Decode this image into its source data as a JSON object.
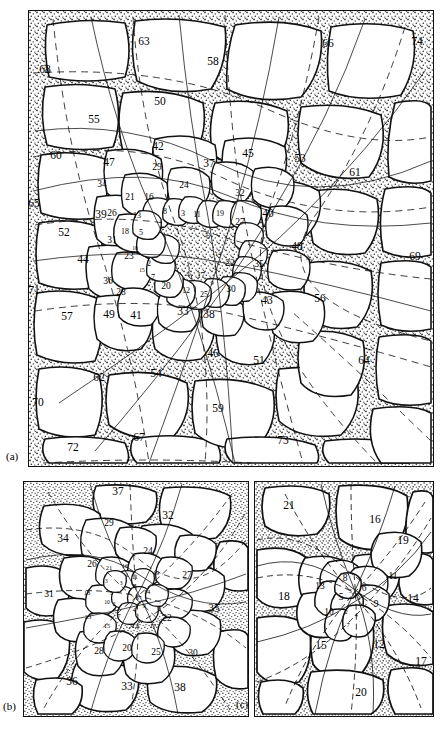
{
  "figure": {
    "type": "phyllotaxis-cell-map",
    "colors": {
      "ink": "#111111",
      "stipple": "#3a3a3a",
      "cell_fill": "#ffffff",
      "paper": "#ffffff"
    }
  },
  "panels": [
    {
      "id": "a",
      "caption": "(a)",
      "cell_count": 74
    },
    {
      "id": "b",
      "caption": "(b)",
      "cell_count": 38
    },
    {
      "id": "c",
      "caption": "(c)",
      "cell_count": 21
    }
  ],
  "panel_a": {
    "caption": "(a)",
    "labels": [
      {
        "n": "1",
        "x": 214,
        "y": 267,
        "s": "t"
      },
      {
        "n": "2",
        "x": 148,
        "y": 263,
        "s": "i"
      },
      {
        "n": "3",
        "x": 182,
        "y": 213,
        "s": "i"
      },
      {
        "n": "4",
        "x": 187,
        "y": 274,
        "s": "i"
      },
      {
        "n": "5",
        "x": 140,
        "y": 232,
        "s": "i"
      },
      {
        "n": "6",
        "x": 207,
        "y": 236,
        "s": "i"
      },
      {
        "n": "7",
        "x": 152,
        "y": 277,
        "s": "i"
      },
      {
        "n": "8",
        "x": 164,
        "y": 211,
        "s": "i"
      },
      {
        "n": "9",
        "x": 211,
        "y": 282,
        "s": "t"
      },
      {
        "n": "10",
        "x": 134,
        "y": 248,
        "s": "vt"
      },
      {
        "n": "11",
        "x": 196,
        "y": 214,
        "s": "i"
      },
      {
        "n": "12",
        "x": 185,
        "y": 290,
        "s": "i"
      },
      {
        "n": "13",
        "x": 136,
        "y": 215,
        "s": "i"
      },
      {
        "n": "14",
        "x": 217,
        "y": 253,
        "s": "t"
      },
      {
        "n": "15",
        "x": 141,
        "y": 270,
        "s": "vt"
      },
      {
        "n": "16",
        "x": 148,
        "y": 197,
        "s": "m"
      },
      {
        "n": "17",
        "x": 200,
        "y": 275,
        "s": "i"
      },
      {
        "n": "18",
        "x": 124,
        "y": 231,
        "s": "i"
      },
      {
        "n": "19",
        "x": 219,
        "y": 213,
        "s": "i"
      },
      {
        "n": "20",
        "x": 165,
        "y": 286,
        "s": "m"
      },
      {
        "n": "21",
        "x": 129,
        "y": 197,
        "s": "m"
      },
      {
        "n": "22",
        "x": 229,
        "y": 263,
        "s": "m"
      },
      {
        "n": "23",
        "x": 128,
        "y": 256,
        "s": "m"
      },
      {
        "n": "24",
        "x": 183,
        "y": 185,
        "s": "m"
      },
      {
        "n": "25",
        "x": 203,
        "y": 294,
        "s": "i"
      },
      {
        "n": "26",
        "x": 111,
        "y": 213,
        "s": "m"
      },
      {
        "n": "27",
        "x": 239,
        "y": 222,
        "s": "m"
      },
      {
        "n": "28",
        "x": 120,
        "y": 292,
        "s": "m"
      },
      {
        "n": "29",
        "x": 156,
        "y": 167,
        "s": "m"
      },
      {
        "n": "30",
        "x": 230,
        "y": 289,
        "s": "m"
      },
      {
        "n": "31",
        "x": 111,
        "y": 240,
        "s": "m"
      },
      {
        "n": "32",
        "x": 239,
        "y": 193,
        "s": "m"
      },
      {
        "n": "33",
        "x": 182,
        "y": 311,
        "s": "o"
      },
      {
        "n": "34",
        "x": 101,
        "y": 184,
        "s": "m"
      },
      {
        "n": "35",
        "x": 258,
        "y": 264,
        "s": "m"
      },
      {
        "n": "36",
        "x": 107,
        "y": 281,
        "s": "m"
      },
      {
        "n": "37",
        "x": 208,
        "y": 163,
        "s": "o"
      },
      {
        "n": "38",
        "x": 208,
        "y": 314,
        "s": "o"
      },
      {
        "n": "39",
        "x": 100,
        "y": 214,
        "s": "o"
      },
      {
        "n": "40",
        "x": 267,
        "y": 213,
        "s": "o"
      },
      {
        "n": "41",
        "x": 135,
        "y": 315,
        "s": "o"
      },
      {
        "n": "42",
        "x": 157,
        "y": 146,
        "s": "o"
      },
      {
        "n": "43",
        "x": 266,
        "y": 300,
        "s": "o"
      },
      {
        "n": "44",
        "x": 82,
        "y": 259,
        "s": "o"
      },
      {
        "n": "45",
        "x": 247,
        "y": 153,
        "s": "o"
      },
      {
        "n": "46",
        "x": 212,
        "y": 353,
        "s": "o"
      },
      {
        "n": "47",
        "x": 108,
        "y": 162,
        "s": "o"
      },
      {
        "n": "48",
        "x": 296,
        "y": 246,
        "s": "o"
      },
      {
        "n": "49",
        "x": 108,
        "y": 314,
        "s": "o"
      },
      {
        "n": "50",
        "x": 159,
        "y": 101,
        "s": "o"
      },
      {
        "n": "51",
        "x": 258,
        "y": 360,
        "s": "o"
      },
      {
        "n": "52",
        "x": 63,
        "y": 232,
        "s": "o"
      },
      {
        "n": "53",
        "x": 299,
        "y": 158,
        "s": "o"
      },
      {
        "n": "54",
        "x": 155,
        "y": 373,
        "s": "o"
      },
      {
        "n": "55",
        "x": 93,
        "y": 119,
        "s": "o"
      },
      {
        "n": "56",
        "x": 319,
        "y": 298,
        "s": "o"
      },
      {
        "n": "57",
        "x": 66,
        "y": 316,
        "s": "o"
      },
      {
        "n": "58",
        "x": 212,
        "y": 61,
        "s": "o"
      },
      {
        "n": "59",
        "x": 217,
        "y": 408,
        "s": "o"
      },
      {
        "n": "60",
        "x": 55,
        "y": 155,
        "s": "o"
      },
      {
        "n": "61",
        "x": 354,
        "y": 172,
        "s": "o"
      },
      {
        "n": "62",
        "x": 98,
        "y": 377,
        "s": "o"
      },
      {
        "n": "63",
        "x": 143,
        "y": 41,
        "s": "o"
      },
      {
        "n": "64",
        "x": 363,
        "y": 360,
        "s": "o"
      },
      {
        "n": "65",
        "x": 33,
        "y": 203,
        "s": "o"
      },
      {
        "n": "66",
        "x": 327,
        "y": 43,
        "s": "o"
      },
      {
        "n": "67",
        "x": 138,
        "y": 437,
        "s": "o"
      },
      {
        "n": "68",
        "x": 44,
        "y": 69,
        "s": "o"
      },
      {
        "n": "69",
        "x": 414,
        "y": 256,
        "s": "o"
      },
      {
        "n": "70",
        "x": 37,
        "y": 402,
        "s": "o"
      },
      {
        "n": "71",
        "x": 33,
        "y": 290,
        "s": "o"
      },
      {
        "n": "72",
        "x": 72,
        "y": 447,
        "s": "o"
      },
      {
        "n": "73",
        "x": 282,
        "y": 440,
        "s": "o"
      },
      {
        "n": "74",
        "x": 416,
        "y": 41,
        "s": "o"
      }
    ]
  },
  "panel_b": {
    "caption": "(b)",
    "labels": [
      {
        "n": "1",
        "x": 126,
        "y": 575,
        "s": "vt"
      },
      {
        "n": "2",
        "x": 113,
        "y": 604,
        "s": "vt"
      },
      {
        "n": "3",
        "x": 120,
        "y": 583,
        "s": "vt"
      },
      {
        "n": "4",
        "x": 133,
        "y": 610,
        "s": "vt"
      },
      {
        "n": "5",
        "x": 110,
        "y": 592,
        "s": "t"
      },
      {
        "n": "6",
        "x": 136,
        "y": 597,
        "s": "t"
      },
      {
        "n": "7",
        "x": 118,
        "y": 615,
        "s": "t"
      },
      {
        "n": "8",
        "x": 133,
        "y": 586,
        "s": "vt"
      },
      {
        "n": "9",
        "x": 143,
        "y": 605,
        "s": "t"
      },
      {
        "n": "10",
        "x": 106,
        "y": 602,
        "s": "vt"
      },
      {
        "n": "11",
        "x": 134,
        "y": 577,
        "s": "vt"
      },
      {
        "n": "12",
        "x": 134,
        "y": 625,
        "s": "t"
      },
      {
        "n": "13",
        "x": 104,
        "y": 581,
        "s": "vt"
      },
      {
        "n": "14",
        "x": 146,
        "y": 591,
        "s": "t"
      },
      {
        "n": "15",
        "x": 106,
        "y": 625,
        "s": "t"
      },
      {
        "n": "16",
        "x": 124,
        "y": 565,
        "s": "t"
      },
      {
        "n": "17",
        "x": 152,
        "y": 625,
        "s": "t"
      },
      {
        "n": "18",
        "x": 86,
        "y": 592,
        "s": "t"
      },
      {
        "n": "19",
        "x": 155,
        "y": 572,
        "s": "t"
      },
      {
        "n": "20",
        "x": 126,
        "y": 648,
        "s": "m"
      },
      {
        "n": "21",
        "x": 108,
        "y": 567,
        "s": "t"
      },
      {
        "n": "22",
        "x": 166,
        "y": 618,
        "s": "m"
      },
      {
        "n": "23",
        "x": 87,
        "y": 616,
        "s": "t"
      },
      {
        "n": "24",
        "x": 147,
        "y": 551,
        "s": "m"
      },
      {
        "n": "25",
        "x": 155,
        "y": 652,
        "s": "m"
      },
      {
        "n": "26",
        "x": 91,
        "y": 564,
        "s": "m"
      },
      {
        "n": "27",
        "x": 186,
        "y": 575,
        "s": "m"
      },
      {
        "n": "28",
        "x": 98,
        "y": 651,
        "s": "m"
      },
      {
        "n": "29",
        "x": 108,
        "y": 523,
        "s": "m"
      },
      {
        "n": "30",
        "x": 192,
        "y": 653,
        "s": "m"
      },
      {
        "n": "31",
        "x": 48,
        "y": 594,
        "s": "m"
      },
      {
        "n": "32",
        "x": 167,
        "y": 515,
        "s": "o"
      },
      {
        "n": "33",
        "x": 126,
        "y": 686,
        "s": "o"
      },
      {
        "n": "34",
        "x": 62,
        "y": 538,
        "s": "o"
      },
      {
        "n": "35",
        "x": 213,
        "y": 608,
        "s": "o"
      },
      {
        "n": "36",
        "x": 71,
        "y": 681,
        "s": "o"
      },
      {
        "n": "37",
        "x": 117,
        "y": 491,
        "s": "o"
      },
      {
        "n": "38",
        "x": 179,
        "y": 687,
        "s": "o"
      }
    ]
  },
  "panel_c": {
    "caption": "(c)",
    "labels": [
      {
        "n": "1",
        "x": 358,
        "y": 597,
        "s": "t"
      },
      {
        "n": "2",
        "x": 345,
        "y": 611,
        "s": "t"
      },
      {
        "n": "3",
        "x": 349,
        "y": 590,
        "s": "t"
      },
      {
        "n": "4",
        "x": 355,
        "y": 614,
        "s": "t"
      },
      {
        "n": "5",
        "x": 340,
        "y": 597,
        "s": "m"
      },
      {
        "n": "6",
        "x": 363,
        "y": 588,
        "s": "m"
      },
      {
        "n": "7",
        "x": 347,
        "y": 624,
        "s": "t"
      },
      {
        "n": "8",
        "x": 344,
        "y": 578,
        "s": "m"
      },
      {
        "n": "9",
        "x": 375,
        "y": 604,
        "s": "m"
      },
      {
        "n": "10",
        "x": 328,
        "y": 612,
        "s": "m"
      },
      {
        "n": "11",
        "x": 392,
        "y": 576,
        "s": "m"
      },
      {
        "n": "12",
        "x": 378,
        "y": 644,
        "s": "o"
      },
      {
        "n": "13",
        "x": 319,
        "y": 586,
        "s": "m"
      },
      {
        "n": "14",
        "x": 412,
        "y": 598,
        "s": "o"
      },
      {
        "n": "15",
        "x": 320,
        "y": 645,
        "s": "o"
      },
      {
        "n": "16",
        "x": 374,
        "y": 519,
        "s": "o"
      },
      {
        "n": "17",
        "x": 420,
        "y": 661,
        "s": "o"
      },
      {
        "n": "18",
        "x": 283,
        "y": 596,
        "s": "o"
      },
      {
        "n": "19",
        "x": 402,
        "y": 540,
        "s": "o"
      },
      {
        "n": "20",
        "x": 360,
        "y": 692,
        "s": "o"
      },
      {
        "n": "21",
        "x": 288,
        "y": 505,
        "s": "o"
      }
    ]
  }
}
